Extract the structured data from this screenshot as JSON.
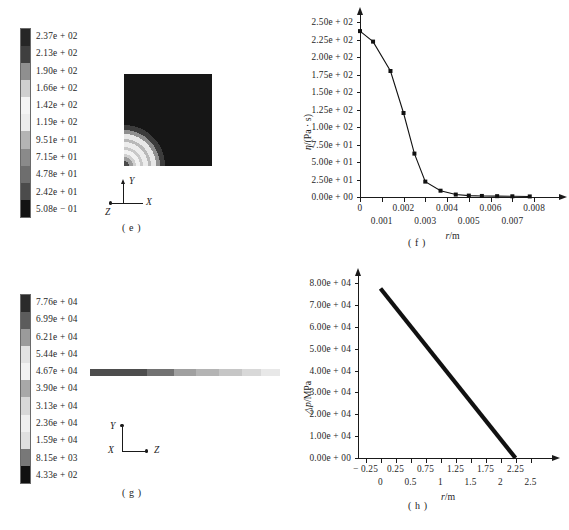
{
  "figure": {
    "panels": [
      "e",
      "f",
      "g",
      "h"
    ]
  },
  "panel_e": {
    "caption": "( e )",
    "colorbar": {
      "labels": [
        "2.37e + 02",
        "2.13e + 02",
        "1.90e + 02",
        "1.66e + 02",
        "1.42e + 02",
        "1.19e + 02",
        "9.51e + 01",
        "7.15e + 01",
        "4.78e + 01",
        "2.42e + 01",
        "5.08e − 01"
      ],
      "colors": [
        "#262626",
        "#3f3f3f",
        "#8f8f8f",
        "#cfcfcf",
        "#f4f4f4",
        "#ececec",
        "#b4b4b4",
        "#8a8a8a",
        "#6e6e6e",
        "#4b4b4b",
        "#121212"
      ],
      "max_value": "2.37e + 02",
      "min_value": "5.08e − 01"
    },
    "triad": {
      "up": "Y",
      "right": "X",
      "diag": "Z"
    }
  },
  "panel_f": {
    "caption": "( f )",
    "chart_data": {
      "type": "line",
      "title": "",
      "xlabel": "r/m",
      "ylabel": "η/(Pa · s)",
      "xlim": [
        0,
        0.0085
      ],
      "ylim": [
        0,
        250
      ],
      "grid": false,
      "marker": "square",
      "x": [
        0.0,
        0.0006,
        0.0014,
        0.002,
        0.0025,
        0.003,
        0.0037,
        0.0044,
        0.005,
        0.0056,
        0.0063,
        0.007,
        0.0078
      ],
      "y": [
        237.0,
        222.0,
        180.0,
        120.0,
        62.0,
        22.0,
        9.0,
        3.5,
        2.0,
        1.5,
        1.2,
        1.0,
        0.8
      ],
      "ytick_labels": [
        "2.50e + 02",
        "2.25e + 02",
        "2.00e + 02",
        "1.75e + 02",
        "1.50e + 02",
        "1.25e + 02",
        "1.00e + 02",
        "7.50e + 01",
        "5.00e + 01",
        "2.50e + 01",
        "0.00e + 00"
      ],
      "ytick_values": [
        250,
        225,
        200,
        175,
        150,
        125,
        100,
        75,
        50,
        25,
        0
      ],
      "xtick_labels_upper": [
        "0",
        "0.002",
        "0.004",
        "0.006",
        "0.008"
      ],
      "xtick_values_upper": [
        0,
        0.002,
        0.004,
        0.006,
        0.008
      ],
      "xtick_labels_lower": [
        "0.001",
        "0.003",
        "0.005",
        "0.007"
      ],
      "xtick_values_lower": [
        0.001,
        0.003,
        0.005,
        0.007
      ]
    }
  },
  "panel_g": {
    "caption": "( g )",
    "colorbar": {
      "labels": [
        "7.76e + 04",
        "6.99e + 04",
        "6.21e + 04",
        "5.44e + 04",
        "4.67e + 04",
        "3.90e + 04",
        "3.13e + 04",
        "2.36e + 04",
        "1.59e + 04",
        "8.15e + 03",
        "4.33e + 02"
      ],
      "colors": [
        "#2b2b2b",
        "#5c5c5c",
        "#9b9b9b",
        "#e2e2e2",
        "#f2f2f2",
        "#a8a8a8",
        "#d8d8d8",
        "#efefef",
        "#e0e0e0",
        "#787878",
        "#111111"
      ],
      "max_value": "7.76e + 04",
      "min_value": "4.33e + 02"
    },
    "strip_colors": [
      "#4d4d4d",
      "#727272",
      "#a0a0a0",
      "#b4b4b4",
      "#c6c6c6",
      "#d8d8d8",
      "#e8e8e8"
    ],
    "triad": {
      "up": "Y",
      "right": "Z",
      "diag": "X"
    }
  },
  "panel_h": {
    "caption": "( h )",
    "chart_data": {
      "type": "line",
      "title": "",
      "xlabel": "r/m",
      "ylabel": "△p/MPa",
      "xlim": [
        -0.375,
        2.625
      ],
      "ylim": [
        0,
        80000
      ],
      "grid": false,
      "marker": "none",
      "x": [
        0.0,
        2.25
      ],
      "y": [
        77500,
        0
      ],
      "ytick_labels": [
        "8.00e + 04",
        "7.00e + 04",
        "6.00e + 04",
        "5.00e + 04",
        "4.00e + 04",
        "3.00e + 04",
        "2.00e + 04",
        "1.00e + 04",
        "0.00e + 00"
      ],
      "ytick_values": [
        80000,
        70000,
        60000,
        50000,
        40000,
        30000,
        20000,
        10000,
        0
      ],
      "xtick_labels_upper": [
        "− 0.25",
        "0.25",
        "0.75",
        "1.25",
        "1.75",
        "2.25"
      ],
      "xtick_values_upper": [
        -0.25,
        0.25,
        0.75,
        1.25,
        1.75,
        2.25
      ],
      "xtick_labels_lower": [
        "0",
        "0.5",
        "1",
        "1.5",
        "2",
        "2.5"
      ],
      "xtick_values_lower": [
        0,
        0.5,
        1,
        1.5,
        2,
        2.5
      ]
    }
  }
}
